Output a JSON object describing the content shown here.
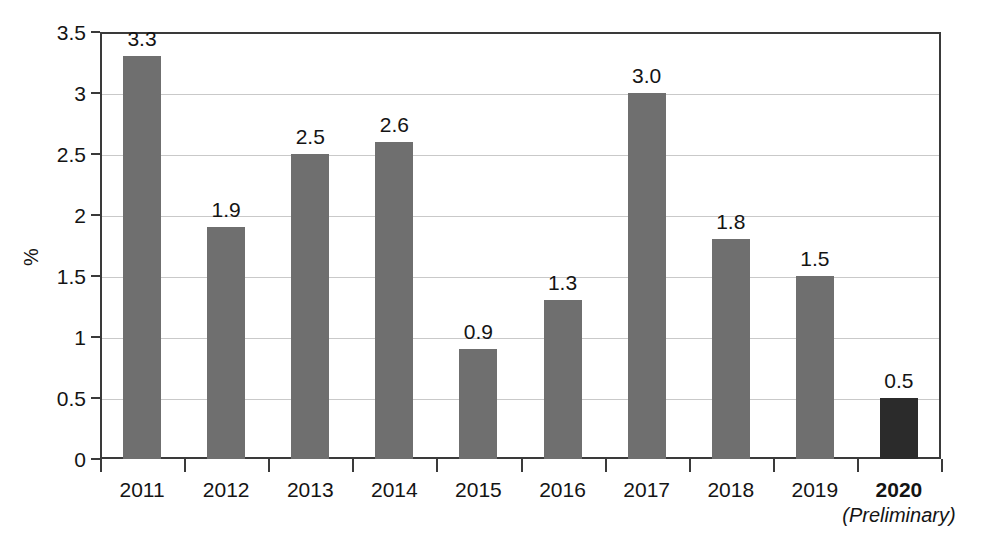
{
  "chart_data": {
    "type": "bar",
    "title": "",
    "subtitle": "",
    "xlabel": "",
    "ylabel": "%",
    "categories": [
      "2011",
      "2012",
      "2013",
      "2014",
      "2015",
      "2016",
      "2017",
      "2018",
      "2019",
      "2020"
    ],
    "values": [
      3.3,
      1.9,
      2.5,
      2.6,
      0.9,
      1.3,
      3.0,
      1.8,
      1.5,
      0.5
    ],
    "value_labels": [
      "3.3",
      "1.9",
      "2.5",
      "2.6",
      "0.9",
      "1.3",
      "3.0",
      "1.8",
      "1.5",
      "0.5"
    ],
    "category_sublabels": [
      "",
      "",
      "",
      "",
      "",
      "",
      "",
      "",
      "",
      "(Preliminary)"
    ],
    "category_bold": [
      false,
      false,
      false,
      false,
      false,
      false,
      false,
      false,
      false,
      true
    ],
    "bar_colors": [
      "#6f6f6f",
      "#6f6f6f",
      "#6f6f6f",
      "#6f6f6f",
      "#6f6f6f",
      "#6f6f6f",
      "#6f6f6f",
      "#6f6f6f",
      "#6f6f6f",
      "#2b2b2b"
    ],
    "ylim": [
      0,
      3.5
    ],
    "y_ticks": [
      0,
      0.5,
      1,
      1.5,
      2,
      2.5,
      3,
      3.5
    ],
    "y_tick_labels": [
      "0",
      "0.5",
      "1",
      "1.5",
      "2",
      "2.5",
      "3",
      "3.5"
    ],
    "grid": true,
    "grid_color": "#c9c9c9",
    "legend": null,
    "legend_position": "none",
    "axis_color": "#3a3a3a",
    "background_color": "#ffffff",
    "highlight_color": "#2b2b2b",
    "series_color": "#6f6f6f",
    "annotations": []
  }
}
